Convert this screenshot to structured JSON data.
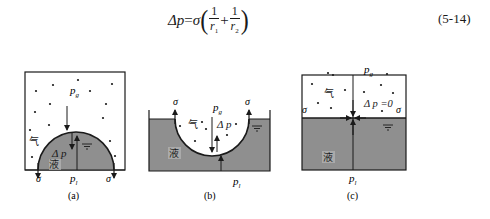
{
  "formula": {
    "lhs": "Δp",
    "equals": "=",
    "sigma": "σ",
    "open_paren": "(",
    "close_paren": ")",
    "plus": "+",
    "frac1": {
      "num": "1",
      "den": "r",
      "den_sub": "1"
    },
    "frac2": {
      "num": "1",
      "den": "r",
      "den_sub": "2"
    },
    "equation_number": "(5-14)"
  },
  "colors": {
    "liquid": "#8f8f8f",
    "line": "#1a1a1a",
    "gas_background": "#ffffff"
  },
  "panels": [
    {
      "id": "a",
      "caption": "(a)",
      "labels": {
        "gas_pressure": "p",
        "gas_pressure_sub": "g",
        "liquid_pressure": "p",
        "liquid_pressure_sub": "l",
        "gas": "气",
        "liquid": "液",
        "delta_p": "Δ p",
        "sigma_left": "σ",
        "sigma_right": "σ"
      },
      "meniscus": "convex"
    },
    {
      "id": "b",
      "caption": "(b)",
      "labels": {
        "gas_pressure": "p",
        "gas_pressure_sub": "g",
        "liquid_pressure": "p",
        "liquid_pressure_sub": "l",
        "gas": "气",
        "liquid": "液",
        "delta_p": "Δ p",
        "sigma_left": "σ",
        "sigma_right": "σ"
      },
      "meniscus": "concave"
    },
    {
      "id": "c",
      "caption": "(c)",
      "labels": {
        "gas_pressure": "p",
        "gas_pressure_sub": "g",
        "liquid_pressure": "p",
        "liquid_pressure_sub": "l",
        "gas": "气",
        "liquid": "液",
        "delta_p": "Δ p =0",
        "sigma_left": "σ",
        "sigma_right": "σ"
      },
      "meniscus": "flat"
    }
  ]
}
